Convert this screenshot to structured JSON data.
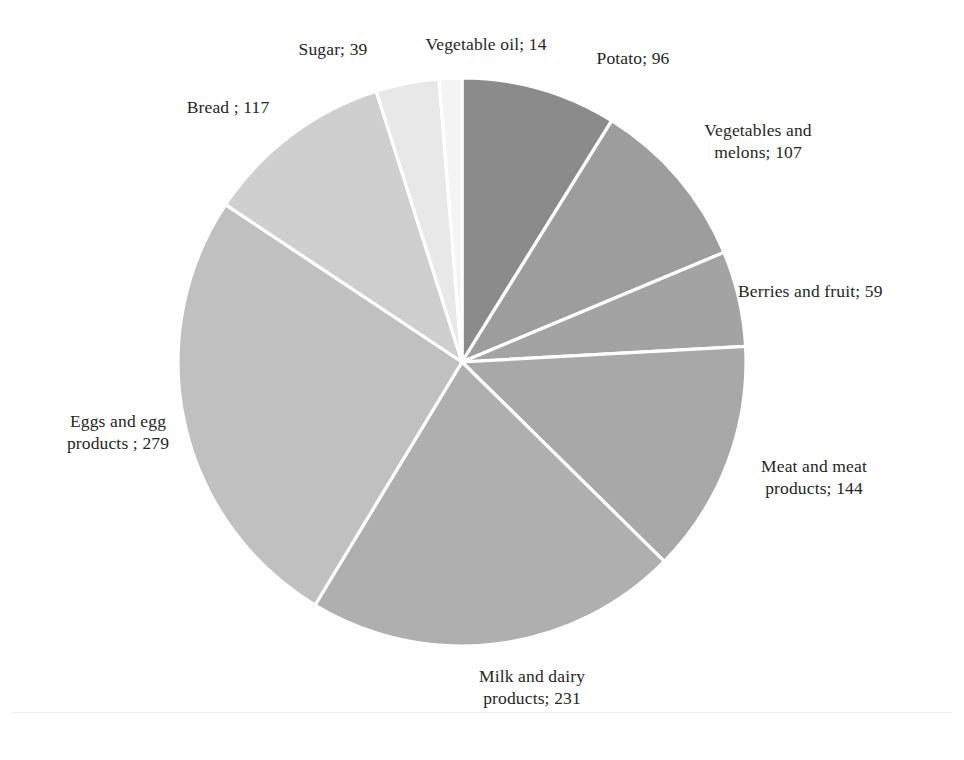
{
  "figure": {
    "background_color": "#ffffff",
    "text_color": "#262626",
    "separator_color": "#ffffff"
  },
  "chart_data": {
    "type": "pie",
    "title": "",
    "subtitle": "",
    "xlabel": "",
    "ylabel": "",
    "legend_position": "none",
    "grid": false,
    "label_format": "name; value",
    "start_angle_deg": 0,
    "direction": "clockwise",
    "total": 1086,
    "categories": [
      "Potato",
      "Vegetables and melons",
      "Berries and fruit",
      "Meat and meat products",
      "Milk and dairy products",
      "Eggs and egg products",
      "Bread",
      "Sugar",
      "Vegetable oil"
    ],
    "values": [
      96,
      107,
      59,
      144,
      231,
      279,
      117,
      39,
      14
    ],
    "colors": [
      "#8b8b8b",
      "#9d9d9d",
      "#a3a3a3",
      "#a8a8a8",
      "#afafaf",
      "#c0c0c0",
      "#cfcfcf",
      "#e8e8e8",
      "#f4f4f4"
    ],
    "labels": [
      "Potato; 96",
      "Vegetables and\nmelons; 107",
      "Berries and fruit; 59",
      "Meat and meat\nproducts; 144",
      "Milk and dairy\nproducts; 231",
      "Eggs and egg\nproducts ; 279",
      "Bread ; 117",
      "Sugar; 39",
      "Vegetable oil; 14"
    ]
  },
  "labels": {
    "potato": "Potato; 96",
    "vegetables_and_melons": "Vegetables and\nmelons; 107",
    "berries_and_fruit": "Berries and fruit; 59",
    "meat_and_meat_products": "Meat and meat\nproducts; 144",
    "milk_and_dairy_products": "Milk and dairy\nproducts; 231",
    "eggs_and_egg_products": "Eggs and egg\nproducts ; 279",
    "bread": "Bread ; 117",
    "sugar": "Sugar; 39",
    "vegetable_oil": "Vegetable oil; 14"
  }
}
